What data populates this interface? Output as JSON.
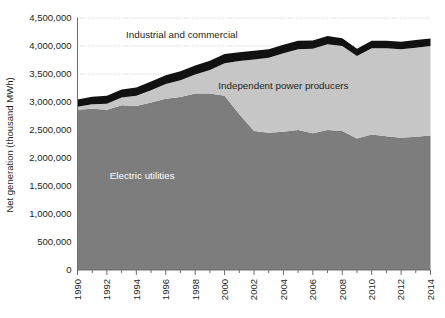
{
  "chart_data": {
    "type": "area",
    "stacked": true,
    "title": "",
    "subtitle": "",
    "xlabel": "",
    "ylabel": "Net generation (thousand MWh)",
    "xlim": [
      1990,
      2014
    ],
    "ylim": [
      0,
      4500000
    ],
    "grid": true,
    "legend_position": "inline-annotations",
    "x": [
      1990,
      1991,
      1992,
      1993,
      1994,
      1995,
      1996,
      1997,
      1998,
      1999,
      2000,
      2001,
      2002,
      2003,
      2004,
      2005,
      2006,
      2007,
      2008,
      2009,
      2010,
      2011,
      2012,
      2013,
      2014
    ],
    "xticks": [
      1990,
      1992,
      1994,
      1996,
      1998,
      2000,
      2002,
      2004,
      2006,
      2008,
      2010,
      2012,
      2014
    ],
    "xticklabels": [
      "1990",
      "1992",
      "1994",
      "1996",
      "1998",
      "2000",
      "2002",
      "2004",
      "2006",
      "2008",
      "2010",
      "2012",
      "2014"
    ],
    "yticks": [
      0,
      500000,
      1000000,
      1500000,
      2000000,
      2500000,
      3000000,
      3500000,
      4000000,
      4500000
    ],
    "yticklabels": [
      "0",
      "500,000",
      "1,000,000",
      "1,500,000",
      "2,000,000",
      "2,500,000",
      "3,000,000",
      "3,500,000",
      "4,000,000",
      "4,500,000"
    ],
    "series": [
      {
        "name": "Electric utilities",
        "color": "#7d7d7d",
        "label_x": 1994.4,
        "label_y": 1620000,
        "label_on_dark": true,
        "values": [
          2860000,
          2880000,
          2860000,
          2940000,
          2930000,
          2990000,
          3060000,
          3090000,
          3150000,
          3150000,
          3110000,
          2780000,
          2480000,
          2450000,
          2470000,
          2500000,
          2440000,
          2500000,
          2480000,
          2350000,
          2420000,
          2390000,
          2360000,
          2380000,
          2400000
        ]
      },
      {
        "name": "Independent power producers",
        "color": "#c6c6c6",
        "label_x": 2004.0,
        "label_y": 3230000,
        "label_on_dark": false,
        "values": [
          55000,
          80000,
          110000,
          140000,
          180000,
          220000,
          260000,
          300000,
          340000,
          420000,
          580000,
          950000,
          1280000,
          1340000,
          1400000,
          1440000,
          1510000,
          1530000,
          1520000,
          1470000,
          1540000,
          1570000,
          1580000,
          1590000,
          1600000
        ]
      },
      {
        "name": "Industrial and commercial",
        "color": "#111111",
        "label_x": 1997.1,
        "label_y": 4140000,
        "label_on_dark": false,
        "values": [
          130000,
          135000,
          140000,
          145000,
          150000,
          155000,
          158000,
          160000,
          162000,
          165000,
          168000,
          160000,
          155000,
          150000,
          152000,
          152000,
          150000,
          148000,
          140000,
          130000,
          135000,
          135000,
          135000,
          135000,
          135000
        ]
      }
    ]
  }
}
